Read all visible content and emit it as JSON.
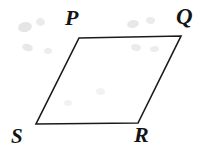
{
  "figure": {
    "kind": "geometry-diagram",
    "shape_name": "parallelogram",
    "background_color": "#ffffff",
    "stroke_color": "#1a1a1a",
    "stroke_width": 1.6,
    "canvas": {
      "width": 206,
      "height": 151
    },
    "vertices": [
      {
        "id": "P",
        "label": "P",
        "x": 79,
        "y": 38,
        "label_position": "above-left"
      },
      {
        "id": "Q",
        "label": "Q",
        "x": 181,
        "y": 36,
        "label_position": "above-right"
      },
      {
        "id": "R",
        "label": "R",
        "x": 138,
        "y": 123,
        "label_position": "below-right"
      },
      {
        "id": "S",
        "label": "S",
        "x": 36,
        "y": 124,
        "label_position": "below-left"
      }
    ],
    "edges": [
      {
        "id": "PQ",
        "from": "P",
        "to": "Q"
      },
      {
        "id": "QR",
        "from": "Q",
        "to": "R"
      },
      {
        "id": "RS",
        "from": "R",
        "to": "S"
      },
      {
        "id": "SP",
        "from": "S",
        "to": "P"
      }
    ],
    "outline_points": "79,38 181,36 138,123 36,124",
    "artifacts": [
      {
        "x": 18,
        "y": 22,
        "w": 14,
        "h": 10,
        "opacity": 0.1,
        "rot": -12
      },
      {
        "x": 36,
        "y": 18,
        "w": 9,
        "h": 8,
        "opacity": 0.08,
        "rot": 8
      },
      {
        "x": 22,
        "y": 44,
        "w": 11,
        "h": 7,
        "opacity": 0.09,
        "rot": 15
      },
      {
        "x": 44,
        "y": 48,
        "w": 8,
        "h": 6,
        "opacity": 0.07,
        "rot": -5
      },
      {
        "x": 127,
        "y": 20,
        "w": 12,
        "h": 8,
        "opacity": 0.09,
        "rot": -10
      },
      {
        "x": 146,
        "y": 17,
        "w": 9,
        "h": 7,
        "opacity": 0.08,
        "rot": 6
      },
      {
        "x": 131,
        "y": 44,
        "w": 10,
        "h": 7,
        "opacity": 0.08,
        "rot": 12
      },
      {
        "x": 150,
        "y": 46,
        "w": 9,
        "h": 6,
        "opacity": 0.07,
        "rot": -8
      },
      {
        "x": 96,
        "y": 88,
        "w": 9,
        "h": 7,
        "opacity": 0.05,
        "rot": 0
      },
      {
        "x": 64,
        "y": 100,
        "w": 8,
        "h": 6,
        "opacity": 0.05,
        "rot": 10
      }
    ]
  }
}
